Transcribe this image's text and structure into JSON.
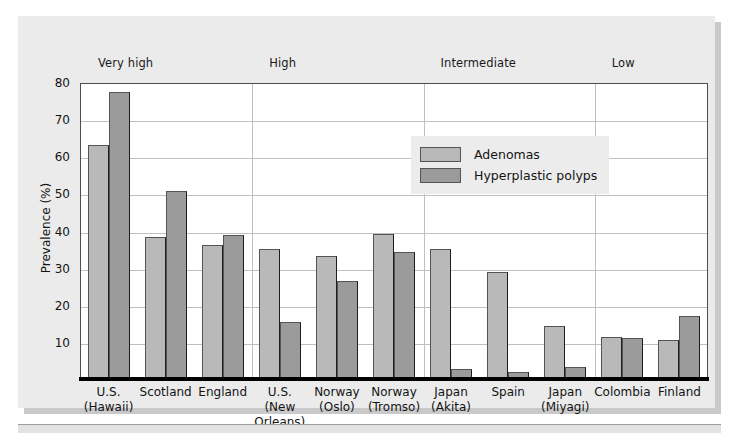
{
  "chart_data": {
    "type": "bar",
    "title": "",
    "xlabel": "",
    "ylabel": "Prevalence (%)",
    "ylim": [
      0,
      80
    ],
    "yticks": [
      10,
      20,
      30,
      40,
      50,
      60,
      70,
      80
    ],
    "grid": true,
    "legend_position": "inside-top-center",
    "categories": [
      "U.S. (Hawaii)",
      "Scotland",
      "England",
      "U.S. (New Orleans)",
      "Norway (Oslo)",
      "Norway (Tromso)",
      "Japan (Akita)",
      "Spain",
      "Japan (Miyagi)",
      "Colombia",
      "Finland"
    ],
    "category_lines": [
      [
        "U.S.",
        "(Hawaii)"
      ],
      [
        "Scotland"
      ],
      [
        "England"
      ],
      [
        "U.S.",
        "(New",
        "Orleans)"
      ],
      [
        "Norway",
        "(Oslo)"
      ],
      [
        "Norway",
        "(Tromso)"
      ],
      [
        "Japan",
        "(Akita)"
      ],
      [
        "Spain"
      ],
      [
        "Japan",
        "(Miyagi)"
      ],
      [
        "Colombia"
      ],
      [
        "Finland"
      ]
    ],
    "series": [
      {
        "name": "Adenomas",
        "color": "#b9b9b9",
        "values": [
          63.2,
          38.6,
          36.5,
          35.3,
          33.4,
          39.4,
          35.4,
          29.0,
          14.6,
          11.7,
          10.7
        ]
      },
      {
        "name": "Hyperplastic polyps",
        "color": "#9b9b9b",
        "values": [
          77.5,
          51.0,
          39.1,
          15.5,
          26.8,
          34.5,
          3.1,
          2.2,
          3.6,
          11.3,
          17.2
        ]
      }
    ],
    "groups": [
      {
        "label": "Very high",
        "span": 3
      },
      {
        "label": "High",
        "span": 3
      },
      {
        "label": "Intermediate",
        "span": 3
      },
      {
        "label": "Low",
        "span": 2
      }
    ]
  },
  "legend": {
    "items": [
      {
        "label": "Adenomas"
      },
      {
        "label": "Hyperplastic polyps"
      }
    ]
  },
  "axis": {
    "y_title": "Prevalence (%)"
  }
}
